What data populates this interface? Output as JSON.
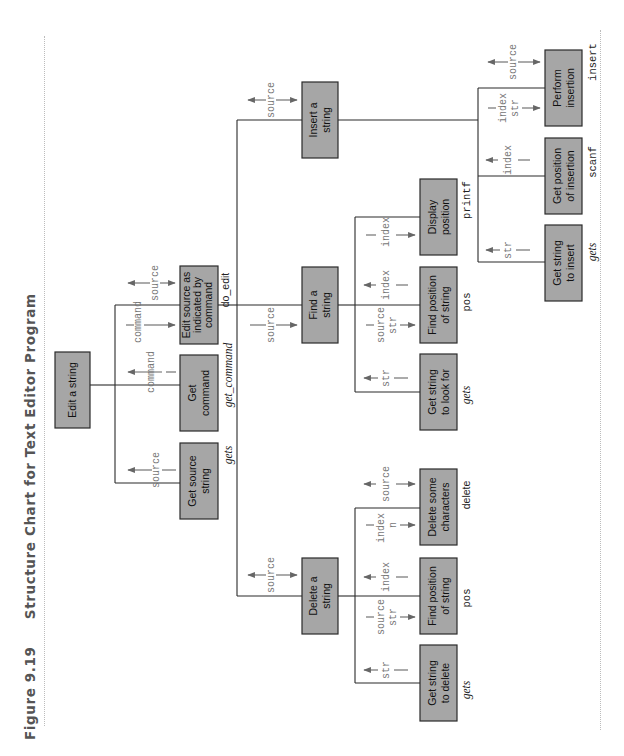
{
  "figure": {
    "number": "Figure 9.19",
    "title": "Structure Chart for Text Editor Program"
  },
  "chart": {
    "root": {
      "label": "Edit a string",
      "children": [
        {
          "id": "get_source",
          "label_lines": [
            "Get source",
            "string"
          ],
          "function": "gets",
          "flows": [
            {
              "name": "source",
              "direction": "up"
            }
          ]
        },
        {
          "id": "get_command",
          "label_lines": [
            "Get",
            "command"
          ],
          "function": "get_command",
          "flows": [
            {
              "name": "command",
              "direction": "up"
            }
          ]
        },
        {
          "id": "do_edit",
          "label_lines": [
            "Edit source as",
            "indicated by",
            "command"
          ],
          "function": "do_edit",
          "flows": [
            {
              "name": "command",
              "direction": "down"
            },
            {
              "name": "source",
              "direction": "both"
            }
          ],
          "children": [
            {
              "id": "delete_string",
              "label_lines": [
                "Delete a",
                "string"
              ],
              "flows": [
                {
                  "name": "source",
                  "direction": "both"
                }
              ],
              "children": [
                {
                  "label_lines": [
                    "Get string",
                    "to delete"
                  ],
                  "function": "gets",
                  "flows": [
                    {
                      "name": "str",
                      "direction": "up"
                    }
                  ]
                },
                {
                  "label_lines": [
                    "Find position",
                    "of string"
                  ],
                  "function": "pos",
                  "flows": [
                    {
                      "name": "source str",
                      "direction": "down"
                    },
                    {
                      "name": "index",
                      "direction": "up"
                    }
                  ]
                },
                {
                  "label_lines": [
                    "Delete some",
                    "characters"
                  ],
                  "function": "delete",
                  "flows": [
                    {
                      "name": "index n",
                      "direction": "down"
                    },
                    {
                      "name": "source",
                      "direction": "both"
                    }
                  ]
                }
              ]
            },
            {
              "id": "find_string",
              "label_lines": [
                "Find a",
                "string"
              ],
              "flows": [
                {
                  "name": "source",
                  "direction": "down"
                }
              ],
              "children": [
                {
                  "label_lines": [
                    "Get string",
                    "to look for"
                  ],
                  "function": "gets",
                  "flows": [
                    {
                      "name": "str",
                      "direction": "up"
                    }
                  ]
                },
                {
                  "label_lines": [
                    "Find position",
                    "of string"
                  ],
                  "function": "pos",
                  "flows": [
                    {
                      "name": "source str",
                      "direction": "down"
                    },
                    {
                      "name": "index",
                      "direction": "up"
                    }
                  ]
                },
                {
                  "label_lines": [
                    "Display",
                    "position"
                  ],
                  "function": "printf",
                  "flows": [
                    {
                      "name": "index",
                      "direction": "down"
                    }
                  ]
                }
              ]
            },
            {
              "id": "insert_string",
              "label_lines": [
                "Insert a",
                "string"
              ],
              "flows": [
                {
                  "name": "source",
                  "direction": "both"
                }
              ],
              "children": [
                {
                  "label_lines": [
                    "Get string",
                    "to insert"
                  ],
                  "function": "gets",
                  "flows": [
                    {
                      "name": "str",
                      "direction": "up"
                    }
                  ]
                },
                {
                  "label_lines": [
                    "Get position",
                    "of insertion"
                  ],
                  "function": "scanf",
                  "flows": [
                    {
                      "name": "index",
                      "direction": "up"
                    }
                  ]
                },
                {
                  "label_lines": [
                    "Perform",
                    "insertion"
                  ],
                  "function": "insert",
                  "flows": [
                    {
                      "name": "index str",
                      "direction": "down"
                    },
                    {
                      "name": "source",
                      "direction": "both"
                    }
                  ]
                }
              ]
            }
          ]
        }
      ]
    }
  },
  "labels": {
    "root": "Edit a string",
    "get_source": [
      "Get source",
      "string"
    ],
    "get_command": [
      "Get",
      "command"
    ],
    "edit_source": [
      "Edit source as",
      "indicated by",
      "command"
    ],
    "delete_string": [
      "Delete a",
      "string"
    ],
    "find_string": [
      "Find a",
      "string"
    ],
    "insert_string": [
      "Insert a",
      "string"
    ],
    "get_string_delete": [
      "Get string",
      "to delete"
    ],
    "find_pos_delete": [
      "Find position",
      "of string"
    ],
    "delete_chars": [
      "Delete some",
      "characters"
    ],
    "get_string_find": [
      "Get string",
      "to look for"
    ],
    "find_pos_find": [
      "Find position",
      "of string"
    ],
    "display_pos": [
      "Display",
      "position"
    ],
    "get_string_insert": [
      "Get string",
      "to insert"
    ],
    "get_pos_insert": [
      "Get position",
      "of insertion"
    ],
    "perform_insert": [
      "Perform",
      "insertion"
    ]
  },
  "functions": {
    "get_source": "gets",
    "get_command": "get_command",
    "do_edit": "do_edit",
    "get_string_delete": "gets",
    "find_pos_delete": "pos",
    "delete_chars": "delete",
    "get_string_find": "gets",
    "find_pos_find": "pos",
    "display_pos": "printf",
    "get_string_insert": "gets",
    "get_pos_insert": "scanf",
    "perform_insert": "insert"
  },
  "params": {
    "source": "source",
    "command": "command",
    "str": "str",
    "index": "index",
    "n": "n"
  }
}
